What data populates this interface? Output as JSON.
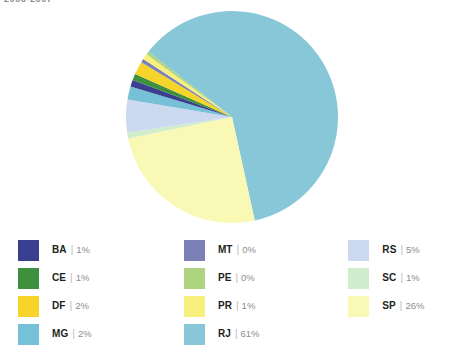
{
  "caption": "2006-2007",
  "chart_data": {
    "type": "pie",
    "title": "2006-2007",
    "categories": [
      "BA",
      "CE",
      "DF",
      "MG",
      "MT",
      "PE",
      "PR",
      "RJ",
      "RS",
      "SC",
      "SP"
    ],
    "values": [
      1,
      1,
      2,
      2,
      0,
      0,
      1,
      61,
      5,
      1,
      26
    ],
    "value_labels": [
      "1%",
      "1%",
      "2%",
      "2%",
      "0%",
      "0%",
      "1%",
      "61%",
      "5%",
      "1%",
      "26%"
    ],
    "unit": "%",
    "legend_position": "bottom",
    "grid": false,
    "slice_order": [
      "RJ",
      "SP",
      "SC",
      "RS",
      "MG",
      "BA",
      "CE",
      "DF",
      "MT",
      "PR",
      "PE"
    ],
    "colors": {
      "BA": "#3b3f8f",
      "CE": "#3e8f3e",
      "DF": "#f7d429",
      "MG": "#76c0d8",
      "MT": "#7b80b8",
      "PE": "#aed47f",
      "PR": "#f8f07e",
      "RJ": "#88c7d8",
      "RS": "#ccd9f0",
      "SC": "#cfeccc",
      "SP": "#f9f8b4"
    }
  },
  "legend": {
    "columns": [
      {
        "items": [
          {
            "code": "BA",
            "pct": "1%",
            "color": "#3b3f8f",
            "separator": "|"
          },
          {
            "code": "CE",
            "pct": "1%",
            "color": "#3e8f3e",
            "separator": "|"
          },
          {
            "code": "DF",
            "pct": "2%",
            "color": "#f7d429",
            "separator": "|"
          },
          {
            "code": "MG",
            "pct": "2%",
            "color": "#76c0d8",
            "separator": "|"
          }
        ]
      },
      {
        "items": [
          {
            "code": "MT",
            "pct": "0%",
            "color": "#7b80b8",
            "separator": "|"
          },
          {
            "code": "PE",
            "pct": "0%",
            "color": "#aed47f",
            "separator": "|"
          },
          {
            "code": "PR",
            "pct": "1%",
            "color": "#f8f07e",
            "separator": "|"
          },
          {
            "code": "RJ",
            "pct": "61%",
            "color": "#88c7d8",
            "separator": "|"
          }
        ]
      },
      {
        "items": [
          {
            "code": "RS",
            "pct": "5%",
            "color": "#ccd9f0",
            "separator": "|"
          },
          {
            "code": "SC",
            "pct": "1%",
            "color": "#cfeccc",
            "separator": "|"
          },
          {
            "code": "SP",
            "pct": "26%",
            "color": "#f9f8b4",
            "separator": "|"
          }
        ]
      }
    ]
  }
}
